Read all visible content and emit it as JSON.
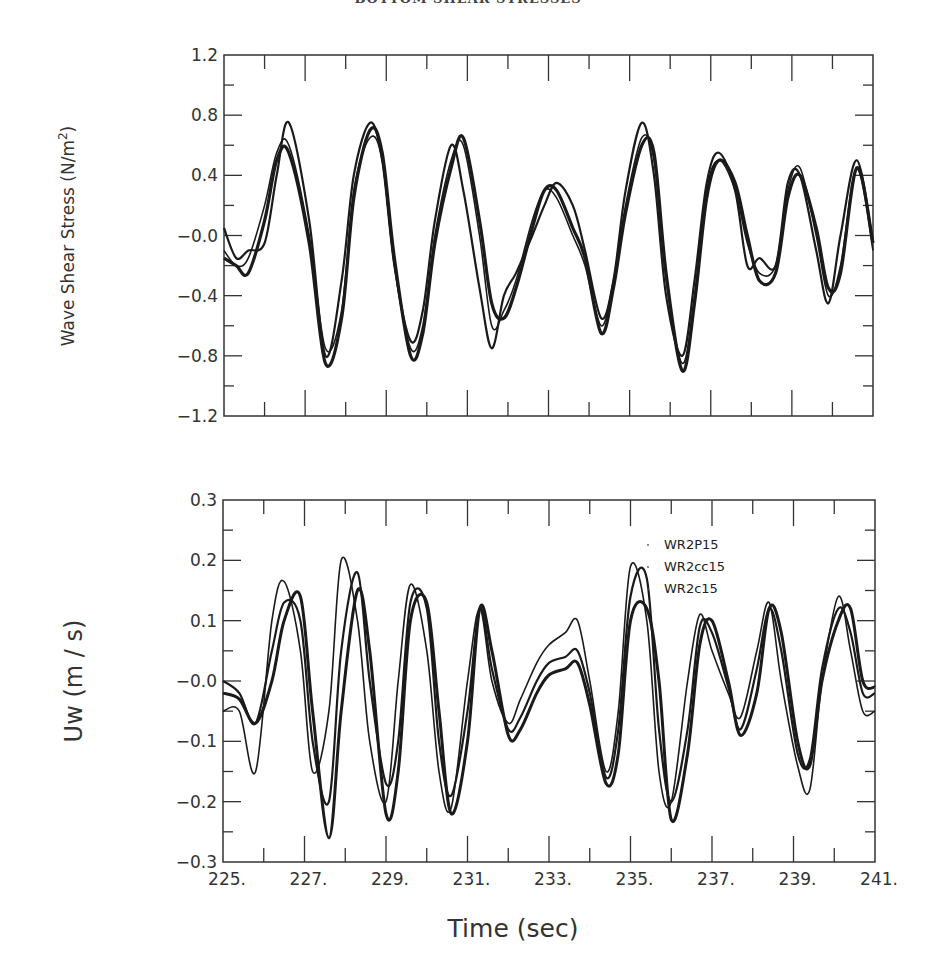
{
  "header": {
    "title": "BOTTOM SHEAR STRESSES"
  },
  "chart_data": [
    {
      "type": "line",
      "title": "",
      "xlabel": "",
      "ylabel": "Wave Shear Stress (N/m2)",
      "xlim": [
        225,
        241
      ],
      "ylim": [
        -1.2,
        1.2
      ],
      "yticks": [
        "1.2",
        "0.8",
        "0.4",
        "-0.0",
        "-0.4",
        "-0.8",
        "-1.2"
      ],
      "ytick_values": [
        1.2,
        0.8,
        0.4,
        0.0,
        -0.4,
        -0.8,
        -1.2
      ],
      "grid": false,
      "legend": null,
      "series": [
        {
          "name": "WR2P15",
          "x": [
            225.0,
            225.3,
            225.6,
            226.0,
            226.3,
            226.6,
            227.1,
            227.5,
            227.9,
            228.2,
            228.6,
            228.9,
            229.2,
            229.6,
            229.9,
            230.2,
            230.6,
            230.9,
            231.3,
            231.6,
            231.9,
            232.2,
            232.6,
            232.9,
            233.2,
            233.6,
            233.9,
            234.3,
            234.6,
            234.9,
            235.3,
            235.6,
            235.9,
            236.3,
            236.6,
            236.9,
            237.2,
            237.6,
            237.9,
            238.2,
            238.6,
            238.9,
            239.2,
            239.6,
            239.9,
            240.2,
            240.6,
            241.0
          ],
          "y": [
            0.05,
            -0.15,
            -0.1,
            -0.05,
            0.4,
            0.75,
            0.1,
            -0.8,
            -0.3,
            0.4,
            0.75,
            0.5,
            -0.2,
            -0.7,
            -0.5,
            0.1,
            0.6,
            0.3,
            -0.35,
            -0.75,
            -0.4,
            -0.25,
            0.0,
            0.2,
            0.35,
            0.2,
            -0.1,
            -0.55,
            -0.3,
            0.3,
            0.75,
            0.4,
            -0.4,
            -0.8,
            -0.3,
            0.35,
            0.55,
            0.3,
            -0.2,
            -0.15,
            -0.2,
            0.35,
            0.4,
            -0.1,
            -0.45,
            0.0,
            0.5,
            -0.05
          ]
        },
        {
          "name": "WR2cc15",
          "x": [
            225.0,
            225.3,
            225.6,
            226.0,
            226.3,
            226.6,
            227.1,
            227.5,
            227.9,
            228.2,
            228.6,
            228.9,
            229.2,
            229.6,
            229.9,
            230.2,
            230.6,
            230.9,
            231.3,
            231.6,
            231.9,
            232.2,
            232.6,
            232.9,
            233.2,
            233.6,
            233.9,
            234.3,
            234.6,
            234.9,
            235.3,
            235.6,
            235.9,
            236.3,
            236.6,
            236.9,
            237.2,
            237.6,
            237.9,
            238.2,
            238.6,
            238.9,
            239.2,
            239.6,
            239.9,
            240.2,
            240.6,
            241.0
          ],
          "y": [
            -0.1,
            -0.2,
            -0.15,
            0.2,
            0.55,
            0.6,
            0.0,
            -0.75,
            -0.5,
            0.3,
            0.65,
            0.5,
            -0.2,
            -0.75,
            -0.6,
            0.0,
            0.5,
            0.6,
            0.0,
            -0.6,
            -0.5,
            -0.3,
            0.1,
            0.3,
            0.25,
            0.0,
            -0.2,
            -0.6,
            -0.3,
            0.2,
            0.65,
            0.5,
            -0.3,
            -0.85,
            -0.4,
            0.3,
            0.5,
            0.3,
            -0.05,
            -0.25,
            -0.2,
            0.3,
            0.45,
            0.0,
            -0.4,
            -0.2,
            0.45,
            -0.1
          ]
        },
        {
          "name": "WR2c15",
          "x": [
            225.0,
            225.3,
            225.6,
            226.0,
            226.3,
            226.6,
            227.1,
            227.5,
            227.9,
            228.2,
            228.6,
            228.9,
            229.2,
            229.6,
            229.9,
            230.2,
            230.6,
            230.9,
            231.3,
            231.6,
            231.9,
            232.2,
            232.6,
            232.9,
            233.2,
            233.6,
            233.9,
            234.3,
            234.6,
            234.9,
            235.3,
            235.6,
            235.9,
            236.3,
            236.6,
            236.9,
            237.2,
            237.6,
            237.9,
            238.2,
            238.6,
            238.9,
            239.2,
            239.6,
            239.9,
            240.2,
            240.6,
            241.0
          ],
          "y": [
            -0.15,
            -0.2,
            -0.25,
            0.1,
            0.5,
            0.55,
            -0.05,
            -0.85,
            -0.55,
            0.25,
            0.7,
            0.55,
            -0.15,
            -0.8,
            -0.65,
            -0.05,
            0.45,
            0.65,
            0.1,
            -0.45,
            -0.55,
            -0.35,
            0.05,
            0.3,
            0.3,
            0.05,
            -0.15,
            -0.65,
            -0.35,
            0.15,
            0.6,
            0.55,
            -0.25,
            -0.9,
            -0.45,
            0.25,
            0.5,
            0.35,
            0.0,
            -0.3,
            -0.25,
            0.25,
            0.4,
            0.05,
            -0.35,
            -0.25,
            0.45,
            -0.05
          ]
        }
      ]
    },
    {
      "type": "line",
      "title": "",
      "xlabel": "Time (sec)",
      "ylabel": "Uw (m/s)",
      "xlim": [
        225,
        241
      ],
      "ylim": [
        -0.3,
        0.3
      ],
      "xticks": [
        "225.",
        "227.",
        "229.",
        "231.",
        "233.",
        "235.",
        "237.",
        "239.",
        "241."
      ],
      "xtick_values": [
        225,
        227,
        229,
        231,
        233,
        235,
        237,
        239,
        241
      ],
      "yticks": [
        "0.3",
        "0.2",
        "0.1",
        "-0.0",
        "-0.1",
        "-0.2",
        "-0.3"
      ],
      "ytick_values": [
        0.3,
        0.2,
        0.1,
        0.0,
        -0.1,
        -0.2,
        -0.3
      ],
      "grid": false,
      "legend": {
        "position": "upper right (inside)",
        "entries": [
          "WR2P15",
          "WR2cc15",
          "WR2c15"
        ]
      },
      "series": [
        {
          "name": "WR2P15",
          "x": [
            225.0,
            225.4,
            225.8,
            226.2,
            226.5,
            226.9,
            227.2,
            227.6,
            227.9,
            228.3,
            228.6,
            229.0,
            229.3,
            229.6,
            230.0,
            230.3,
            230.6,
            231.0,
            231.3,
            231.6,
            232.0,
            232.3,
            232.7,
            233.0,
            233.4,
            233.7,
            234.0,
            234.4,
            234.7,
            235.0,
            235.4,
            235.7,
            236.0,
            236.4,
            236.7,
            237.0,
            237.4,
            237.7,
            238.1,
            238.4,
            238.7,
            239.1,
            239.4,
            239.7,
            240.1,
            240.4,
            240.7,
            241.0
          ],
          "y": [
            -0.05,
            -0.05,
            -0.15,
            0.1,
            0.165,
            0.05,
            -0.15,
            -0.05,
            0.2,
            0.1,
            -0.1,
            -0.2,
            0.0,
            0.16,
            0.05,
            -0.15,
            -0.21,
            0.0,
            0.12,
            0.0,
            -0.07,
            -0.03,
            0.03,
            0.06,
            0.08,
            0.1,
            0.0,
            -0.15,
            -0.05,
            0.19,
            0.1,
            -0.15,
            -0.2,
            0.0,
            0.11,
            0.05,
            -0.02,
            -0.06,
            0.05,
            0.13,
            0.0,
            -0.14,
            -0.18,
            0.0,
            0.14,
            0.05,
            -0.05,
            -0.05
          ]
        },
        {
          "name": "WR2cc15",
          "x": [
            225.0,
            225.4,
            225.8,
            226.2,
            226.5,
            226.9,
            227.2,
            227.6,
            227.9,
            228.3,
            228.6,
            229.0,
            229.3,
            229.6,
            230.0,
            230.3,
            230.6,
            231.0,
            231.3,
            231.6,
            232.0,
            232.3,
            232.7,
            233.0,
            233.4,
            233.7,
            234.0,
            234.4,
            234.7,
            235.0,
            235.4,
            235.7,
            236.0,
            236.4,
            236.7,
            237.0,
            237.4,
            237.7,
            238.1,
            238.4,
            238.7,
            239.1,
            239.4,
            239.7,
            240.1,
            240.4,
            240.7,
            241.0
          ],
          "y": [
            0.0,
            -0.02,
            -0.07,
            0.05,
            0.13,
            0.1,
            -0.1,
            -0.2,
            0.05,
            0.18,
            0.0,
            -0.17,
            -0.1,
            0.13,
            0.12,
            -0.1,
            -0.19,
            -0.05,
            0.12,
            0.02,
            -0.08,
            -0.06,
            0.0,
            0.03,
            0.04,
            0.05,
            -0.02,
            -0.16,
            -0.08,
            0.14,
            0.17,
            -0.08,
            -0.2,
            -0.08,
            0.09,
            0.08,
            -0.01,
            -0.08,
            0.02,
            0.12,
            0.05,
            -0.12,
            -0.13,
            0.02,
            0.12,
            0.08,
            -0.02,
            -0.02
          ]
        },
        {
          "name": "WR2c15",
          "x": [
            225.0,
            225.4,
            225.8,
            226.2,
            226.5,
            226.9,
            227.2,
            227.6,
            227.9,
            228.3,
            228.6,
            229.0,
            229.3,
            229.6,
            230.0,
            230.3,
            230.6,
            231.0,
            231.3,
            231.6,
            232.0,
            232.3,
            232.7,
            233.0,
            233.4,
            233.7,
            234.0,
            234.4,
            234.7,
            235.0,
            235.4,
            235.7,
            236.0,
            236.4,
            236.7,
            237.0,
            237.4,
            237.7,
            238.1,
            238.4,
            238.7,
            239.1,
            239.4,
            239.7,
            240.1,
            240.4,
            240.7,
            241.0
          ],
          "y": [
            -0.02,
            -0.03,
            -0.07,
            0.0,
            0.1,
            0.14,
            -0.05,
            -0.26,
            -0.05,
            0.15,
            0.05,
            -0.22,
            -0.15,
            0.1,
            0.13,
            -0.05,
            -0.22,
            -0.1,
            0.12,
            0.05,
            -0.09,
            -0.08,
            -0.02,
            0.01,
            0.02,
            0.03,
            -0.04,
            -0.17,
            -0.12,
            0.1,
            0.12,
            0.0,
            -0.23,
            -0.12,
            0.06,
            0.1,
            0.0,
            -0.09,
            -0.02,
            0.12,
            0.08,
            -0.1,
            -0.14,
            0.0,
            0.1,
            0.12,
            0.0,
            -0.01
          ]
        }
      ]
    }
  ]
}
